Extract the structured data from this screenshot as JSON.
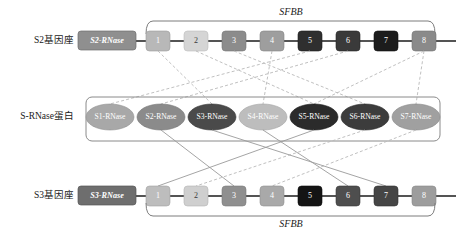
{
  "diagram": {
    "title_note": "S-RNase / SFBB self-incompatibility locus diagram",
    "rows": {
      "top": {
        "label": "S2基因座",
        "rnase_box": {
          "text": "S2-RNase",
          "color": "#8f8f8f"
        },
        "bracket_label": "SFBB",
        "genes": [
          {
            "num": "1",
            "color": "#b8b8b8"
          },
          {
            "num": "2",
            "color": "#d5d5d5"
          },
          {
            "num": "3",
            "color": "#8c8c8c"
          },
          {
            "num": "4",
            "color": "#9e9e9e"
          },
          {
            "num": "5",
            "color": "#2f2f2f"
          },
          {
            "num": "6",
            "color": "#3a3a3a"
          },
          {
            "num": "7",
            "color": "#1c1c1c"
          },
          {
            "num": "8",
            "color": "#8a8a8a"
          }
        ]
      },
      "middle": {
        "label": "S-RNase蛋白",
        "proteins": [
          {
            "text": "S1-RNase",
            "color": "#a8a8a8"
          },
          {
            "text": "S2-RNase",
            "color": "#8b8b8b"
          },
          {
            "text": "S3-RNase",
            "color": "#4a4a4a"
          },
          {
            "text": "S4-RNase",
            "color": "#bdbdbd"
          },
          {
            "text": "S5-RNase",
            "color": "#2b2b2b"
          },
          {
            "text": "S6-RNase",
            "color": "#3c3c3c"
          },
          {
            "text": "S7-RNase",
            "color": "#a0a0a0"
          }
        ]
      },
      "bottom": {
        "label": "S3基因座",
        "rnase_box": {
          "text": "S3-RNase",
          "color": "#6e6e6e"
        },
        "bracket_label": "SFBB",
        "genes": [
          {
            "num": "1",
            "color": "#bdbdbd"
          },
          {
            "num": "2",
            "color": "#cfcfcf"
          },
          {
            "num": "3",
            "color": "#8f8f8f"
          },
          {
            "num": "4",
            "color": "#a9a9a9"
          },
          {
            "num": "5",
            "color": "#141414"
          },
          {
            "num": "6",
            "color": "#4e4e4e"
          },
          {
            "num": "7",
            "color": "#454545"
          },
          {
            "num": "8",
            "color": "#9d9d9d"
          }
        ]
      }
    },
    "colors": {
      "backbone": "#1b1b1b",
      "bracket": "#7d7d7d",
      "frame": "#8a8a8a",
      "link_solid": "#9a9a9a",
      "link_dashed": "#b9b9b9",
      "text": "#1a1a1a"
    },
    "geometry": {
      "gene_x": [
        158,
        196,
        234,
        272,
        310,
        348,
        386,
        424
      ],
      "protein_x": [
        110,
        161,
        212,
        263,
        314,
        365,
        416
      ],
      "top_y": 41,
      "mid_y": 117,
      "bottom_y": 196
    },
    "links_top": [
      {
        "gene": 0,
        "protein": 2,
        "style": "dashed"
      },
      {
        "gene": 1,
        "protein": 4,
        "style": "dashed"
      },
      {
        "gene": 2,
        "protein": 5,
        "style": "dashed"
      },
      {
        "gene": 3,
        "protein": 3,
        "style": "dashed"
      },
      {
        "gene": 4,
        "protein": 0,
        "style": "dashed"
      },
      {
        "gene": 5,
        "protein": 1,
        "style": "dashed"
      },
      {
        "gene": 7,
        "protein": 6,
        "style": "dashed"
      },
      {
        "gene": 7,
        "protein": 4,
        "style": "dashed"
      }
    ],
    "links_bottom": [
      {
        "gene": 0,
        "protein": 4,
        "style": "solid"
      },
      {
        "gene": 1,
        "protein": 5,
        "style": "dashed"
      },
      {
        "gene": 2,
        "protein": 1,
        "style": "solid"
      },
      {
        "gene": 3,
        "protein": 6,
        "style": "dashed"
      },
      {
        "gene": 5,
        "protein": 3,
        "style": "solid"
      },
      {
        "gene": 6,
        "protein": 2,
        "style": "solid"
      }
    ]
  }
}
